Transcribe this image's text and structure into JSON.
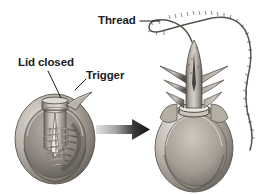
{
  "figure": {
    "background_color": "#ffffff",
    "ink_color": "#1b1b1b",
    "panels": [
      {
        "name": "undischarged-nematocyst",
        "caption": "Nematocyst before discharge, lid closed with coiled thread inside capsule"
      },
      {
        "name": "discharged-nematocyst",
        "caption": "Nematocyst after discharge, barbed shaft everted with thread extended"
      }
    ]
  },
  "labels": {
    "lid_closed": "Lid closed",
    "trigger": "Trigger",
    "thread": "Thread"
  },
  "arrow": {
    "name": "transition-arrow",
    "direction": "right",
    "gradient_from": "#d8d8d8",
    "gradient_to": "#111111"
  },
  "colors": {
    "capsule_light": "#cfcac3",
    "capsule_mid": "#9a948c",
    "capsule_dark": "#5f5a54",
    "capsule_shadow": "#3d3a36",
    "thread_line": "#55514c",
    "leader_line": "#1b1b1b"
  }
}
